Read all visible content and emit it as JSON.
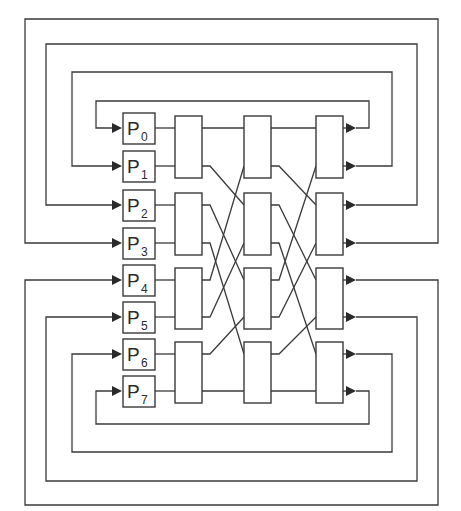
{
  "diagram": {
    "type": "omega-network",
    "processors": [
      {
        "id": "P0",
        "letter": "P",
        "index": "0"
      },
      {
        "id": "P1",
        "letter": "P",
        "index": "1"
      },
      {
        "id": "P2",
        "letter": "P",
        "index": "2"
      },
      {
        "id": "P3",
        "letter": "P",
        "index": "3"
      },
      {
        "id": "P4",
        "letter": "P",
        "index": "4"
      },
      {
        "id": "P5",
        "letter": "P",
        "index": "5"
      },
      {
        "id": "P6",
        "letter": "P",
        "index": "6"
      },
      {
        "id": "P7",
        "letter": "P",
        "index": "7"
      }
    ],
    "stages": 3,
    "switches_per_stage": 4,
    "interconnect": "perfect-shuffle",
    "colors": {
      "line": "#3a3a3a",
      "background": "#ffffff"
    }
  }
}
